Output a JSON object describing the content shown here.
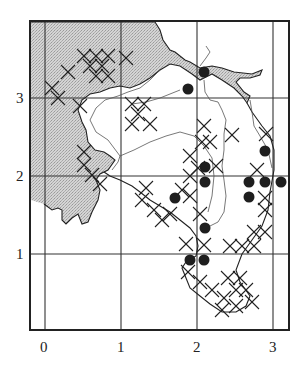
{
  "figure": {
    "frame": {
      "x0": 30,
      "y0": 21,
      "x1": 289,
      "y1": 330
    },
    "colors": {
      "ink": "#222222",
      "shade": "#c8c8c8",
      "grid": "#333333",
      "dot": "#1e1e1e",
      "thin": "#555555"
    },
    "grid": {
      "vertical": [
        {
          "x": 45,
          "label": "0"
        },
        {
          "x": 121,
          "label": "1"
        },
        {
          "x": 197,
          "label": "2"
        },
        {
          "x": 273,
          "label": "3"
        }
      ],
      "horizontal": [
        {
          "y": 98,
          "label": "3"
        },
        {
          "y": 176,
          "label": "2"
        },
        {
          "y": 254,
          "label": "1"
        }
      ]
    },
    "x_labels": [
      {
        "text": "0",
        "x": 40,
        "y": 340
      },
      {
        "text": "1",
        "x": 117,
        "y": 340
      },
      {
        "text": "2",
        "x": 193,
        "y": 340
      },
      {
        "text": "3",
        "x": 269,
        "y": 340
      }
    ],
    "y_labels": [
      {
        "text": "3",
        "x": 16,
        "y": 91
      },
      {
        "text": "2",
        "x": 16,
        "y": 169
      },
      {
        "text": "1",
        "x": 16,
        "y": 247
      }
    ],
    "dots": [
      [
        204,
        72
      ],
      [
        188,
        89
      ],
      [
        265,
        151
      ],
      [
        205,
        167
      ],
      [
        205,
        182
      ],
      [
        249,
        182
      ],
      [
        265,
        182
      ],
      [
        281,
        182
      ],
      [
        175,
        198
      ],
      [
        249,
        197
      ],
      [
        205,
        228
      ],
      [
        190,
        260
      ],
      [
        204,
        260
      ]
    ],
    "crosses": [
      [
        84,
        56
      ],
      [
        96,
        56
      ],
      [
        108,
        56
      ],
      [
        90,
        66
      ],
      [
        102,
        66
      ],
      [
        96,
        76
      ],
      [
        108,
        76
      ],
      [
        126,
        58
      ],
      [
        68,
        72
      ],
      [
        52,
        88
      ],
      [
        58,
        98
      ],
      [
        80,
        106
      ],
      [
        132,
        104
      ],
      [
        144,
        104
      ],
      [
        138,
        114
      ],
      [
        132,
        124
      ],
      [
        150,
        124
      ],
      [
        84,
        152
      ],
      [
        84,
        165
      ],
      [
        92,
        175
      ],
      [
        100,
        184
      ],
      [
        204,
        126
      ],
      [
        202,
        142
      ],
      [
        210,
        142
      ],
      [
        232,
        135
      ],
      [
        266,
        134
      ],
      [
        190,
        156
      ],
      [
        198,
        168
      ],
      [
        216,
        166
      ],
      [
        190,
        176
      ],
      [
        182,
        190
      ],
      [
        190,
        196
      ],
      [
        146,
        188
      ],
      [
        142,
        200
      ],
      [
        154,
        210
      ],
      [
        162,
        220
      ],
      [
        170,
        214
      ],
      [
        200,
        214
      ],
      [
        204,
        245
      ],
      [
        186,
        244
      ],
      [
        257,
        170
      ],
      [
        265,
        198
      ],
      [
        265,
        210
      ],
      [
        254,
        232
      ],
      [
        265,
        232
      ],
      [
        242,
        246
      ],
      [
        254,
        246
      ],
      [
        230,
        246
      ],
      [
        188,
        272
      ],
      [
        200,
        282
      ],
      [
        212,
        290
      ],
      [
        224,
        298
      ],
      [
        236,
        290
      ],
      [
        228,
        278
      ],
      [
        240,
        278
      ],
      [
        246,
        290
      ],
      [
        252,
        302
      ],
      [
        236,
        306
      ],
      [
        222,
        310
      ]
    ],
    "shaded_region": "M31,22 L155,22 L160,30 L163,40 L170,50 L175,52 L185,60 L190,62 L200,68 L212,66 L222,68 L234,72 L252,74 L262,70 L260,75 L250,78 L240,78 L236,82 L244,92 L250,96 L247,103 L242,96 L234,88 L222,80 L212,74 L200,80 L192,74 L180,66 L170,64 L160,70 L150,78 L140,84 L130,88 L120,86 L110,88 L100,92 L90,94 L82,100 L78,110 L82,122 L86,130 L88,142 L95,150 L104,152 L110,156 L115,160 L108,170 L100,174 L96,180 L100,190 L98,200 L92,212 L88,222 L82,224 L78,214 L72,218 L66,224 L62,220 L62,210 L58,208 L52,210 L44,204 L31,200 Z",
    "land_outline": "M31,22 L155,22 L160,30 L163,40 L170,50 L175,52 L185,60 L190,62 L200,68 L212,66 L222,68 L234,72 L252,74 L262,70 L260,75 L250,78 L240,78 L236,82 L244,92 L250,96 L247,103 L242,96 L234,88 L222,80 L212,74 L200,80 L192,74 L180,66 L170,64 L160,70 L150,78 L140,84 L130,88 L120,86 L110,88 L100,92 L90,94 L82,100 L78,110 L82,122 L86,130 L88,142 L95,150 L104,152 L110,156 L115,160 L108,170 L100,174 L96,180 L100,190 L98,200 L92,212 L88,222 L82,224 L78,214 L72,218 L66,224 L62,220 L62,210 L58,208 L52,210 L44,204",
    "island_coast": "M247,103 L252,112 L262,126 L270,136 L274,150 L274,170 L270,192 L268,210 L262,226 L252,240 L242,254 L236,270 L240,282 L250,296 L246,306 L236,312 L222,312 L210,304 L200,296 L190,288 L186,278 L182,268 L186,262 L196,256 L198,246 L196,236 L190,228 L180,220 L170,212 L160,206 L150,200 L140,192 L132,186 L120,180 L110,176 L104,172",
    "rivers": [
      "M160,70 L150,80 L140,88 L128,92 L118,96 L105,100 L96,108 L90,120 L96,132 L108,140 L114,148 L120,156 L118,162 L112,170",
      "M204,80 L205,92 L210,100 L218,102 L222,110 L226,120 L224,134 L224,150 L222,166 L224,180 L226,196 L224,212 L218,222 L210,226",
      "M180,90 L170,94 L160,98 L146,102 L132,104",
      "M120,156 L134,150 L150,142 L166,136 L180,132 L194,136 L204,146 L212,158 L214,176 L212,196 L208,212",
      "M250,100 L252,112 L254,126 L260,136 L268,150 L272,168",
      "M200,66 L206,58 L210,52 L206,46"
    ]
  }
}
